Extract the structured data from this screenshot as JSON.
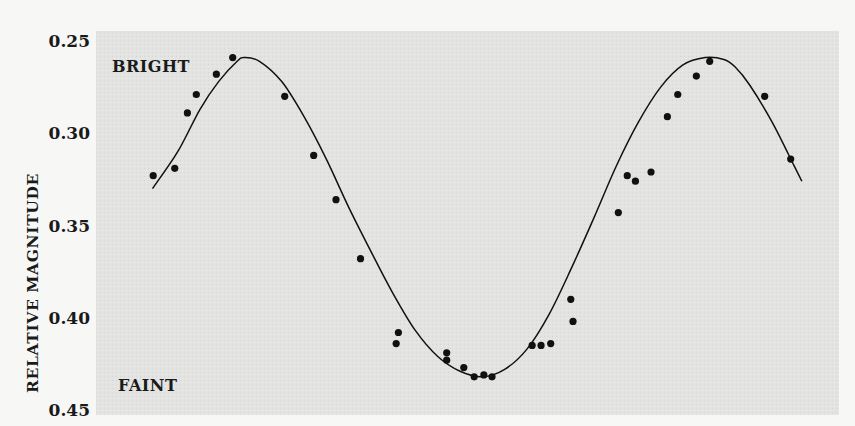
{
  "chart_data": {
    "type": "scatter",
    "title": "",
    "xlabel": "",
    "ylabel": "RELATIVE MAGNITUDE",
    "ylim": [
      0.25,
      0.45
    ],
    "y_inverted": true,
    "yticks": [
      "0.25",
      "0.30",
      "0.35",
      "0.40",
      "0.45"
    ],
    "ytick_values": [
      0.25,
      0.3,
      0.35,
      0.4,
      0.45
    ],
    "grid": false,
    "legend": null,
    "annotations": [
      {
        "text": "BRIGHT",
        "near_y": 0.26
      },
      {
        "text": "FAINT",
        "near_y": 0.435
      }
    ],
    "x_note": "x axis unlabeled; x given as fraction of plot width (0 = left edge, 1 = right edge)",
    "series": [
      {
        "name": "observations",
        "kind": "points",
        "x": [
          0.077,
          0.106,
          0.123,
          0.135,
          0.162,
          0.184,
          0.254,
          0.293,
          0.323,
          0.356,
          0.407,
          0.404,
          0.472,
          0.472,
          0.495,
          0.509,
          0.522,
          0.533,
          0.587,
          0.599,
          0.612,
          0.639,
          0.642,
          0.703,
          0.715,
          0.726,
          0.747,
          0.769,
          0.783,
          0.808,
          0.826,
          0.9,
          0.935
        ],
        "y": [
          0.323,
          0.319,
          0.289,
          0.279,
          0.268,
          0.259,
          0.28,
          0.312,
          0.336,
          0.368,
          0.408,
          0.414,
          0.419,
          0.423,
          0.427,
          0.432,
          0.431,
          0.432,
          0.415,
          0.415,
          0.414,
          0.39,
          0.402,
          0.343,
          0.323,
          0.326,
          0.321,
          0.291,
          0.279,
          0.269,
          0.261,
          0.28,
          0.314
        ]
      },
      {
        "name": "fitted curve",
        "kind": "line",
        "x": [
          0.076,
          0.11,
          0.14,
          0.165,
          0.19,
          0.2,
          0.22,
          0.25,
          0.28,
          0.31,
          0.34,
          0.37,
          0.4,
          0.43,
          0.46,
          0.49,
          0.52,
          0.55,
          0.58,
          0.61,
          0.64,
          0.67,
          0.7,
          0.73,
          0.76,
          0.79,
          0.82,
          0.845,
          0.86,
          0.88,
          0.91,
          0.94,
          0.95
        ],
        "y": [
          0.33,
          0.31,
          0.287,
          0.272,
          0.261,
          0.259,
          0.261,
          0.272,
          0.291,
          0.314,
          0.34,
          0.364,
          0.387,
          0.407,
          0.421,
          0.429,
          0.432,
          0.428,
          0.417,
          0.398,
          0.373,
          0.346,
          0.318,
          0.294,
          0.275,
          0.263,
          0.259,
          0.26,
          0.264,
          0.274,
          0.294,
          0.318,
          0.326
        ]
      }
    ]
  },
  "plot": {
    "background": "#e3e3e1",
    "ink": "#111111",
    "page_background": "#f7f7f5"
  }
}
